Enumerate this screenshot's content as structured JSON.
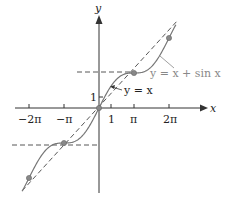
{
  "chart_data": {
    "type": "line",
    "title": "",
    "xlabel": "x",
    "ylabel": "y",
    "x_ticks": [
      "-2π",
      "-π",
      "1",
      "π",
      "2π"
    ],
    "y_ticks": [
      "1"
    ],
    "series": [
      {
        "name": "y = x + sin x",
        "style": "solid",
        "color": "#777777",
        "x": [
          -6.8,
          -6.2832,
          -4.7124,
          -3.1416,
          -1.5708,
          0,
          1.5708,
          3.1416,
          4.7124,
          6.2832,
          6.8
        ],
        "values": [
          -7.294,
          -6.2832,
          -3.7124,
          -3.1416,
          -2.5708,
          0,
          2.5708,
          3.1416,
          3.7124,
          6.2832,
          7.294
        ]
      },
      {
        "name": "y = x",
        "style": "dashed",
        "color": "#444444",
        "x": [
          -7,
          7
        ],
        "values": [
          -7,
          7
        ]
      }
    ],
    "marked_points": [
      [
        -6.2832,
        -6.2832
      ],
      [
        -3.1416,
        -3.1416
      ],
      [
        0,
        0
      ],
      [
        3.1416,
        3.1416
      ],
      [
        6.2832,
        6.2832
      ]
    ],
    "reference_lines": [
      {
        "y": 3.1416,
        "style": "dashed"
      },
      {
        "y": -3.1416,
        "style": "dashed"
      }
    ],
    "annotations": [
      "y = x + sin x",
      "y = x"
    ],
    "grid": false
  },
  "labels": {
    "x_axis": "x",
    "y_axis": "y",
    "tick_neg2pi": "−2π",
    "tick_negpi": "−π",
    "tick_one_x": "1",
    "tick_pi": "π",
    "tick_2pi": "2π",
    "tick_one_y": "1",
    "curve_label": "y = x + sin x",
    "line_label": "y = x"
  }
}
